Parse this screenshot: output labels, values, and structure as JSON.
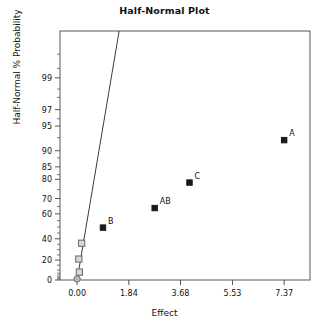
{
  "chart_data": {
    "type": "scatter",
    "title": "Half-Normal Plot",
    "xlabel": "Effect",
    "ylabel": "Half-Normal % Probability",
    "xlim": [
      -0.61,
      8.29
    ],
    "ylim": [
      0,
      99
    ],
    "grid": false,
    "legend": null,
    "x_ticks": [
      "0.00",
      "1.84",
      "3.68",
      "5.53",
      "7.37"
    ],
    "x_tick_values": [
      0.0,
      1.84,
      3.68,
      5.53,
      7.37
    ],
    "y_ticks": [
      "0",
      "20",
      "40",
      "60",
      "70",
      "80",
      "85",
      "90",
      "95",
      "97",
      "99"
    ],
    "y_tick_values": [
      0,
      20,
      40,
      60,
      70,
      80,
      85,
      90,
      95,
      97,
      99
    ],
    "reference_line": {
      "name": "half-normal-reference-line",
      "x0": 0.0,
      "y0": 0.0,
      "x1": 1.55,
      "y1": 99.9
    },
    "points": [
      {
        "label": "",
        "x": 0.0,
        "y": 1.0,
        "marker": "circle",
        "style": "gray-filled"
      },
      {
        "label": "",
        "x": 0.08,
        "y": 8.0,
        "marker": "square",
        "style": "gray-open"
      },
      {
        "label": "",
        "x": 0.06,
        "y": 21.0,
        "marker": "square",
        "style": "gray-open"
      },
      {
        "label": "",
        "x": 0.16,
        "y": 36.0,
        "marker": "square",
        "style": "gray-open"
      },
      {
        "label": "B",
        "x": 0.92,
        "y": 49.5,
        "marker": "square",
        "style": "black-filled"
      },
      {
        "label": "AB",
        "x": 2.76,
        "y": 64.0,
        "marker": "square",
        "style": "black-filled"
      },
      {
        "label": "C",
        "x": 4.0,
        "y": 78.5,
        "marker": "square",
        "style": "black-filled"
      },
      {
        "label": "A",
        "x": 7.37,
        "y": 92.5,
        "marker": "square",
        "style": "black-filled"
      }
    ],
    "colors": {
      "axis": "#555555",
      "point_black": "#1a1a1a",
      "point_gray_fill": "#b8b8b8",
      "point_gray_stroke": "#707070",
      "line": "#3a3a3a",
      "background": "#ffffff"
    }
  }
}
